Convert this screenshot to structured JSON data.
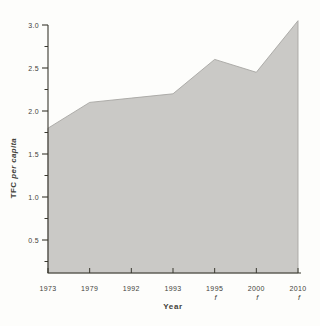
{
  "chart_data": {
    "type": "area",
    "title": "",
    "xlabel": "Year",
    "ylabel": "TFC per capita",
    "ylabel_parts": {
      "bold": "TFC",
      "italic": "per capita"
    },
    "categories": [
      "1973",
      "1979",
      "1992",
      "1993",
      "1995",
      "2000",
      "2010"
    ],
    "values": [
      1.8,
      2.1,
      2.15,
      2.2,
      2.6,
      2.45,
      3.05
    ],
    "forecast_flags": [
      false,
      false,
      false,
      false,
      true,
      true,
      true
    ],
    "forecast_marker": "f",
    "y_ticks": [
      0.5,
      1.0,
      1.5,
      2.0,
      2.5,
      3.0
    ],
    "y_tick_labels": [
      "0.5",
      "1.0",
      "1.5",
      "2.0",
      "2.5",
      "3.0"
    ],
    "y_minor_ticks": [
      0.25,
      0.75,
      1.25,
      1.75,
      2.25,
      2.75
    ],
    "ylim": [
      0.1,
      3.1
    ],
    "grid": false,
    "legend": "none",
    "colors": {
      "fill": "#cac9c6",
      "line": "#a7a6a3",
      "axis": "#39382f",
      "text": "#43423a",
      "background": "#fdfdfb"
    }
  }
}
